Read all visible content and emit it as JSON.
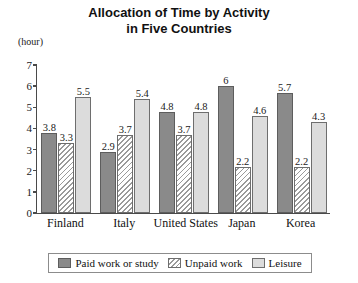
{
  "chart_data": {
    "type": "bar",
    "title": "Allocation of Time by Activity in Five Countries",
    "title_line1": "Allocation of Time by Activity",
    "title_line2": "in Five Countries",
    "unit_label": "(hour)",
    "xlabel": "",
    "ylabel": "",
    "ylim": [
      0,
      7
    ],
    "y_ticks": [
      "0",
      "1",
      "2",
      "3",
      "4",
      "5",
      "6",
      "7"
    ],
    "grid": false,
    "legend_position": "bottom",
    "categories": [
      "Finland",
      "Italy",
      "United States",
      "Japan",
      "Korea"
    ],
    "series": [
      {
        "name": "Paid work or study",
        "color": "#8a8a8a",
        "fill": "solid-dark-gray",
        "values": [
          3.8,
          2.9,
          4.8,
          6,
          5.7
        ],
        "labels": [
          "3.8",
          "2.9",
          "4.8",
          "6",
          "5.7"
        ]
      },
      {
        "name": "Unpaid work",
        "color": "#ffffff",
        "fill": "diagonal-hatch",
        "values": [
          3.3,
          3.7,
          3.7,
          2.2,
          2.2
        ],
        "labels": [
          "3.3",
          "3.7",
          "3.7",
          "2.2",
          "2.2"
        ]
      },
      {
        "name": "Leisure",
        "color": "#dcdcdc",
        "fill": "solid-light-gray",
        "values": [
          5.5,
          5.4,
          4.8,
          4.6,
          4.3
        ],
        "labels": [
          "5.5",
          "5.4",
          "4.8",
          "4.6",
          "4.3"
        ]
      }
    ]
  },
  "legend": {
    "items": [
      {
        "label": "Paid work or study",
        "swatch": "paid"
      },
      {
        "label": "Unpaid work",
        "swatch": "unpaid"
      },
      {
        "label": "Leisure",
        "swatch": "leisure"
      }
    ]
  }
}
